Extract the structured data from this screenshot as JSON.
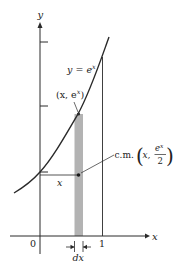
{
  "diagram": {
    "type": "calculus-figure",
    "colors": {
      "ink": "#2a2a2a",
      "strip": "#b3b3b3",
      "background": "#ffffff"
    },
    "axes": {
      "x_label": "x",
      "y_label": "y",
      "x_ticks": [
        "0",
        "1"
      ]
    },
    "curve": {
      "label": "y = e",
      "label_exponent": "x"
    },
    "point_top": {
      "label_prefix": "(x, e",
      "label_exponent": "x",
      "label_suffix": ")"
    },
    "center_of_mass": {
      "prefix": "c.m.",
      "x_coord": "x,",
      "numerator": "e",
      "numerator_exponent": "x",
      "denominator": "2"
    },
    "distance_label": "x",
    "width_label": "dx"
  }
}
